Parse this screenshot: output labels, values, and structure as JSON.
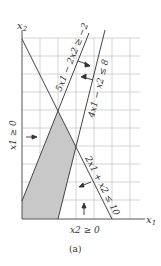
{
  "figure": {
    "caption": "(a)",
    "axes": {
      "x_label": "x1",
      "y_label": "x2",
      "grid": true,
      "unit_px": 18,
      "x_range": [
        0,
        6
      ],
      "y_range": [
        0,
        10
      ]
    },
    "constraints": [
      {
        "id": "c1",
        "label": "5x1 − 2x2 ≥ −2",
        "points": [
          [
            0,
            1
          ],
          [
            3.6,
            10
          ]
        ]
      },
      {
        "id": "c2",
        "label": "4x1 − x2 ≤ 8",
        "points": [
          [
            2,
            0
          ],
          [
            4.6,
            10.5
          ]
        ]
      },
      {
        "id": "c3",
        "label": "2x1 + x2 ≤ 10",
        "points": [
          [
            0,
            10
          ],
          [
            5,
            0
          ]
        ]
      },
      {
        "id": "c4",
        "label": "x1 ≥ 0"
      },
      {
        "id": "c5",
        "label": "x2 ≥ 0"
      }
    ],
    "feasible_region": {
      "vertices": [
        [
          0,
          0
        ],
        [
          0,
          1
        ],
        [
          2,
          6
        ],
        [
          3,
          4
        ],
        [
          2,
          0
        ]
      ],
      "fill": "#c8c8c8"
    },
    "colors": {
      "grid": "#c9c9c9",
      "line": "#444444",
      "text": "#333333"
    }
  }
}
